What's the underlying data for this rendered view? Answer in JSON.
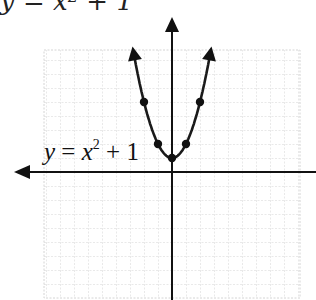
{
  "title": {
    "text_visible": "y = x² + 1",
    "cut_off": true
  },
  "chart_data": {
    "type": "line",
    "title": "y = x² + 1",
    "equation": "y = x^2 + 1",
    "xlabel": "",
    "ylabel": "",
    "grid": true,
    "axis_arrows": [
      "left",
      "up",
      "down"
    ],
    "xlim": [
      -9,
      9
    ],
    "ylim": [
      -9,
      9
    ],
    "plotted_points": [
      {
        "x": -2,
        "y": 5
      },
      {
        "x": -1,
        "y": 2
      },
      {
        "x": 0,
        "y": 1
      },
      {
        "x": 1,
        "y": 2
      },
      {
        "x": 2,
        "y": 5
      }
    ],
    "curve_label": {
      "var_y": "y",
      "equals": "=",
      "var_x": "x",
      "exponent": "2",
      "plus_const": "+ 1"
    },
    "colors": {
      "curve": "#1a1a1a",
      "axes": "#111111",
      "grid": "#bdbdbd",
      "background": "#ffffff"
    }
  }
}
